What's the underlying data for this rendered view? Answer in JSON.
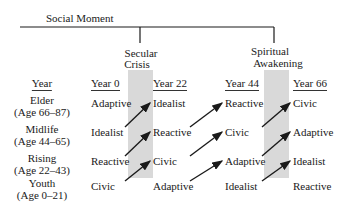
{
  "title": "Social Moment",
  "moments": [
    {
      "label_line1": "Secular",
      "label_line2": "Crisis"
    },
    {
      "label_line1": "Spiritual",
      "label_line2": "Awakening"
    }
  ],
  "row_header": "Year",
  "columns": [
    "Year 0",
    "Year 22",
    "Year 44",
    "Year 66"
  ],
  "rows": [
    {
      "name": "Elder",
      "ages": "(Age 66–87)"
    },
    {
      "name": "Midlife",
      "ages": "(Age 44–65)"
    },
    {
      "name": "Rising",
      "ages": "(Age 22–43)"
    },
    {
      "name": "Youth",
      "ages": "(Age 0–21)"
    }
  ],
  "grid": [
    [
      "Adaptive",
      "Idealist",
      "Reactive",
      "Civic"
    ],
    [
      "Idealist",
      "Reactive",
      "Civic",
      "Adaptive"
    ],
    [
      "Reactive",
      "Civic",
      "Adaptive",
      "Idealist"
    ],
    [
      "Civic",
      "Adaptive",
      "Idealist",
      "Reactive"
    ]
  ],
  "colors": {
    "shade": "#d9d9d9",
    "ink": "#1a1a1a"
  }
}
